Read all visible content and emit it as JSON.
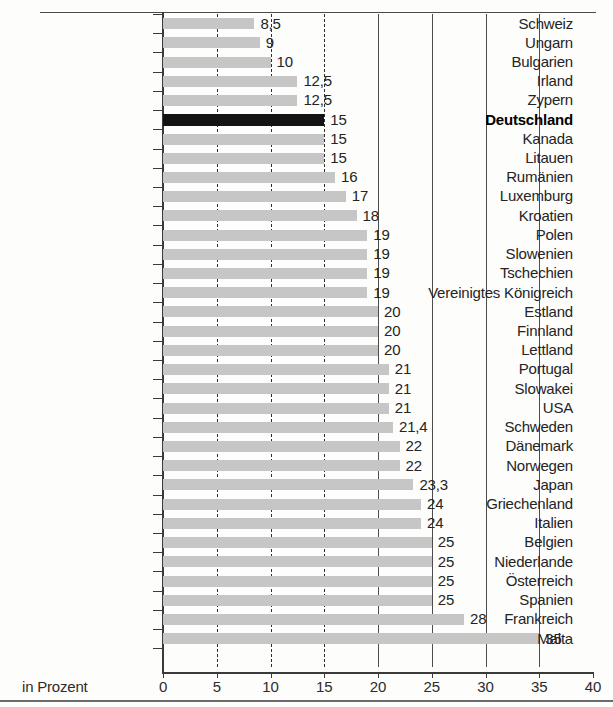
{
  "chart_data": {
    "type": "bar",
    "orientation": "horizontal",
    "title": "",
    "subtitle": "",
    "xlabel": "in Prozent",
    "ylabel": "",
    "xlim": [
      0,
      40
    ],
    "xticks": [
      0,
      5,
      10,
      15,
      20,
      25,
      30,
      35,
      40
    ],
    "xtick_labels": [
      "0",
      "5",
      "10",
      "15",
      "20",
      "25",
      "30",
      "35",
      "40"
    ],
    "grid": true,
    "gridlines_dashed": [
      5,
      10,
      15
    ],
    "gridlines_solid": [
      20,
      25,
      30,
      35
    ],
    "legend": null,
    "highlight_category": "Deutschland",
    "highlight_color": "#141414",
    "bar_color": "#c6c6c6",
    "categories": [
      "Schweiz",
      "Ungarn",
      "Bulgarien",
      "Irland",
      "Zypern",
      "Deutschland",
      "Kanada",
      "Litauen",
      "Rumänien",
      "Luxemburg",
      "Kroatien",
      "Polen",
      "Slowenien",
      "Tschechien",
      "Vereinigtes Königreich",
      "Estland",
      "Finnland",
      "Lettland",
      "Portugal",
      "Slowakei",
      "USA",
      "Schweden",
      "Dänemark",
      "Norwegen",
      "Japan",
      "Griechenland",
      "Italien",
      "Belgien",
      "Niederlande",
      "Österreich",
      "Spanien",
      "Frankreich",
      "Malta"
    ],
    "values": [
      8.5,
      9,
      10,
      12.5,
      12.5,
      15,
      15,
      15,
      16,
      17,
      18,
      19,
      19,
      19,
      19,
      20,
      20,
      20,
      21,
      21,
      21,
      21.4,
      22,
      22,
      23.3,
      24,
      24,
      25,
      25,
      25,
      25,
      28,
      35
    ],
    "value_labels": [
      "8,5",
      "9",
      "10",
      "12,5",
      "12,5",
      "15",
      "15",
      "15",
      "16",
      "17",
      "18",
      "19",
      "19",
      "19",
      "19",
      "20",
      "20",
      "20",
      "21",
      "21",
      "21",
      "21,4",
      "22",
      "22",
      "23,3",
      "24",
      "24",
      "25",
      "25",
      "25",
      "25",
      "28",
      "35"
    ]
  },
  "axis": {
    "unit_label": "in Prozent"
  }
}
